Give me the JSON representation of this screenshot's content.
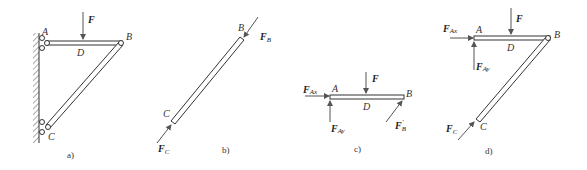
{
  "figure": {
    "panels": [
      {
        "id": "a",
        "caption": "a)",
        "points": {
          "A": "A",
          "B": "B",
          "C": "C",
          "D": "D"
        },
        "forces": {
          "F": "F"
        }
      },
      {
        "id": "b",
        "caption": "b)",
        "points": {
          "B": "B",
          "C": "C"
        },
        "forces": {
          "FB": "F",
          "FB_sub": "B",
          "FC": "F",
          "FC_sub": "C"
        }
      },
      {
        "id": "c",
        "caption": "c)",
        "points": {
          "A": "A",
          "B": "B",
          "D": "D"
        },
        "forces": {
          "F": "F",
          "FAx": "F",
          "FAx_sub": "Ax",
          "FAy": "F",
          "FAy_sub": "Ay",
          "FBp": "F",
          "FBp_sub": "B",
          "FBp_prime": "'"
        }
      },
      {
        "id": "d",
        "caption": "d)",
        "points": {
          "A": "A",
          "B": "B",
          "C": "C",
          "D": "D"
        },
        "forces": {
          "F": "F",
          "FAx": "F",
          "FAx_sub": "Ax",
          "FAy": "F",
          "FAy_sub": "Ay",
          "FC": "F",
          "FC_sub": "C"
        }
      }
    ],
    "colors": {
      "line": "#333333",
      "arrow": "#555555"
    }
  }
}
